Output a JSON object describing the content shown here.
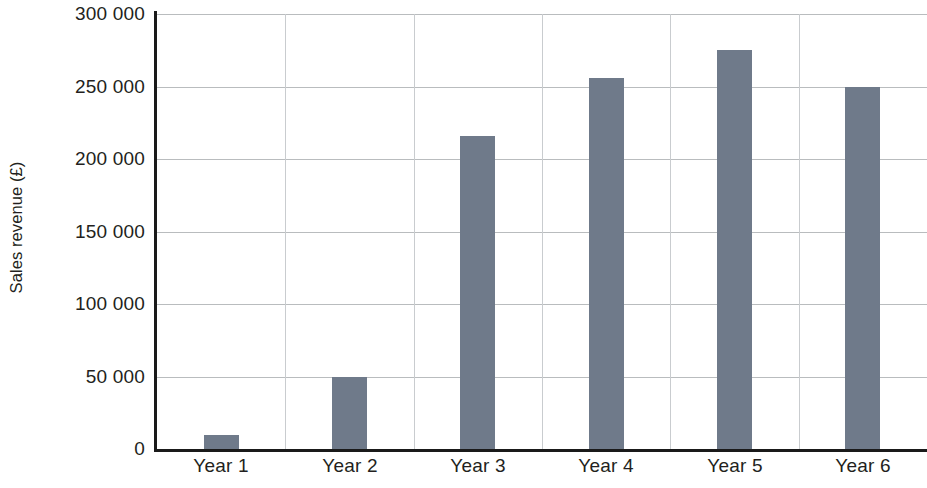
{
  "chart_data": {
    "type": "bar",
    "title": "",
    "subtitle": "",
    "xlabel": "",
    "ylabel": "Sales revenue (£)",
    "categories": [
      "Year 1",
      "Year 2",
      "Year 3",
      "Year 4",
      "Year 5",
      "Year 6"
    ],
    "values": [
      10000,
      50000,
      216000,
      256000,
      275000,
      250000
    ],
    "series": [
      {
        "name": "Sales revenue",
        "values": [
          10000,
          50000,
          216000,
          256000,
          275000,
          250000
        ]
      }
    ],
    "ylim": [
      0,
      300000
    ],
    "ytick_values": [
      0,
      50000,
      100000,
      150000,
      200000,
      250000,
      300000
    ],
    "ytick_labels": [
      "0",
      "50 000",
      "100 000",
      "150 000",
      "200 000",
      "250 000",
      "300 000"
    ],
    "grid": {
      "horizontal": true,
      "vertical": true,
      "vertical_count": 5
    },
    "legend": {
      "visible": false,
      "position": "none",
      "entries": []
    },
    "colors": {
      "bar": "#6f7a8a",
      "axis": "#1a1a1a",
      "gridline": "#b9bcbe",
      "gridline_vertical": "#c9cccf",
      "text": "#231f20",
      "background": "#ffffff"
    },
    "annotations": []
  }
}
